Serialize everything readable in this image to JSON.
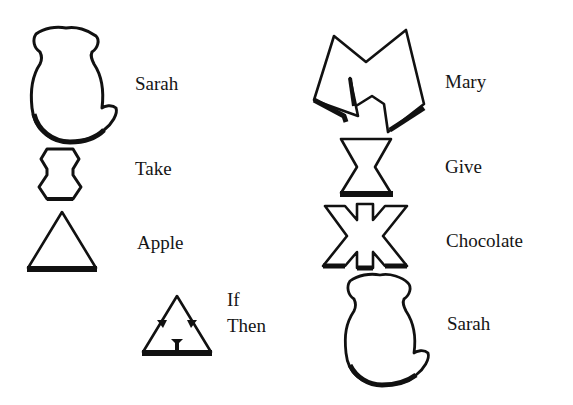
{
  "diagram": {
    "left_column": [
      {
        "symbol": "monkey-icon",
        "label": "Sarah"
      },
      {
        "symbol": "take-icon",
        "label": "Take"
      },
      {
        "symbol": "triangle-icon",
        "label": "Apple"
      },
      {
        "symbol": "if-then-triangle-icon",
        "label_line1": "If",
        "label_line2": "Then"
      }
    ],
    "right_column": [
      {
        "symbol": "m-shape-icon",
        "label": "Mary"
      },
      {
        "symbol": "hourglass-icon",
        "label": "Give"
      },
      {
        "symbol": "star-shape-icon",
        "label": "Chocolate"
      },
      {
        "symbol": "monkey-icon",
        "label": "Sarah"
      }
    ]
  }
}
